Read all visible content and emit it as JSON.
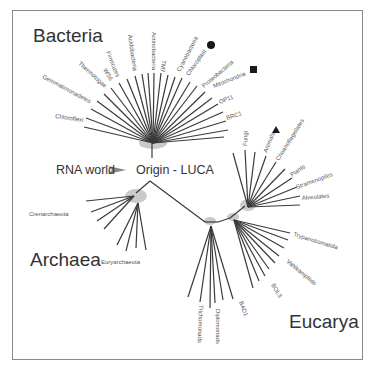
{
  "domains": {
    "bacteria": "Bacteria",
    "archaea": "Archaea",
    "eucarya": "Eucarya"
  },
  "root": {
    "origin_label": "Origin - LUCA",
    "rna_world_label": "RNA world"
  },
  "bacteria_taxa": [
    "Chloroflexi",
    "Gemmatimonadetes",
    "Thermotogae",
    "WS6",
    "Firmicutes",
    "Acidobacteria",
    "Actinobacteria",
    "TM7",
    "Cyanobacteria",
    "Chloroplast",
    "Proteobacteria",
    "Mitochondria",
    "OP11",
    "BRC1"
  ],
  "archaea_taxa": [
    "Crenarchaeota",
    "Euryarchaeota"
  ],
  "eucarya_taxa": [
    "Fungi",
    "Animals",
    "Choanoflagellates",
    "Plants",
    "Stramenopiles",
    "Alveolates",
    "Trypanosomatida",
    "Vahlkampfiids",
    "BOL3",
    "BAD1",
    "Diplomonads",
    "Trichomonads"
  ],
  "markers": {
    "chloroplast": "circle",
    "mitochondria": "square",
    "animals": "triangle"
  },
  "colors": {
    "branch": "#3a3a3a",
    "node_halo": "#b0b0b0",
    "frame": "#8a8a8a",
    "text": "#333333"
  }
}
